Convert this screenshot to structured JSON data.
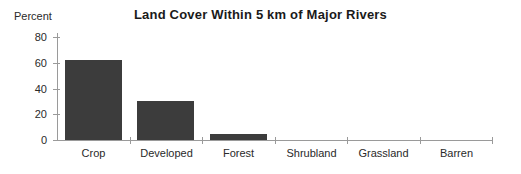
{
  "chart_data": {
    "type": "bar",
    "title": "Land Cover Within 5 km of Major Rivers",
    "ylabel": "Percent",
    "xlabel": "",
    "categories": [
      "Crop",
      "Developed",
      "Forest",
      "Shrubland",
      "Grassland",
      "Barren"
    ],
    "values": [
      62,
      30,
      5,
      0,
      0,
      0
    ],
    "ylim": [
      0,
      80
    ],
    "yticks": [
      0,
      20,
      40,
      60,
      80
    ],
    "grid": false,
    "legend": false,
    "bar_color": "#3c3c3c",
    "axis_color": "#9a9a9a",
    "text_color": "#2a2a2a",
    "background_color": "#ffffff"
  }
}
